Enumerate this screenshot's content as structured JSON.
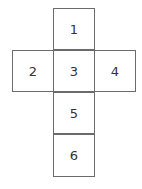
{
  "diagram": {
    "type": "cube-net",
    "faces": [
      {
        "label": "1",
        "row": 0,
        "col": 1
      },
      {
        "label": "2",
        "row": 1,
        "col": 0
      },
      {
        "label": "3",
        "row": 1,
        "col": 1
      },
      {
        "label": "4",
        "row": 1,
        "col": 2
      },
      {
        "label": "5",
        "row": 2,
        "col": 1
      },
      {
        "label": "6",
        "row": 3,
        "col": 1
      }
    ]
  }
}
